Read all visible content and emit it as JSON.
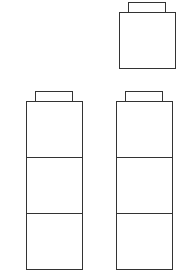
{
  "diagram": {
    "stroke_color": "#333333",
    "single_block": {
      "count": 1
    },
    "left_stack": {
      "count": 3
    },
    "right_stack": {
      "count": 3
    }
  }
}
